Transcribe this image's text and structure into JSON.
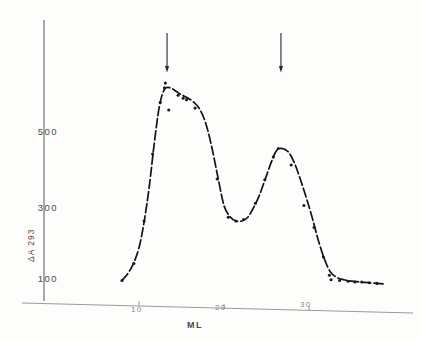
{
  "chart_data": {
    "type": "line",
    "title": "",
    "xlabel": "ML",
    "ylabel": "ΔA 293",
    "xlim": [
      0,
      40
    ],
    "ylim": [
      0,
      700
    ],
    "grid": false,
    "legend": null,
    "x_ticks": [
      {
        "value": 10,
        "label": "10"
      },
      {
        "value": 20,
        "label": "20"
      },
      {
        "value": 30,
        "label": "30"
      }
    ],
    "y_ticks": [
      {
        "value": 500,
        "label": "500"
      },
      {
        "value": 300,
        "label": "300"
      },
      {
        "value": 100,
        "label": "100"
      }
    ],
    "series": [
      {
        "name": "ΔA 293 elution profile",
        "style": "dashed-with-points",
        "x": [
          8.0,
          8.6,
          9.3,
          10.0,
          10.6,
          11.2,
          11.8,
          12.4,
          13.0,
          13.7,
          14.4,
          15.1,
          15.8,
          16.5,
          17.2,
          17.9,
          18.6,
          19.3,
          20.0,
          20.7,
          21.4,
          22.1,
          22.8,
          23.5,
          24.2,
          24.9,
          25.6,
          26.2,
          26.9,
          27.6,
          28.3,
          29.0,
          29.7,
          30.4,
          31.1,
          31.8,
          32.5,
          33.3,
          34.1,
          35.0,
          36.0,
          37.0,
          38.0,
          39.0
        ],
        "y": [
          96,
          112,
          140,
          185,
          255,
          350,
          470,
          570,
          616,
          620,
          610,
          600,
          592,
          580,
          560,
          520,
          455,
          375,
          300,
          270,
          258,
          258,
          268,
          295,
          330,
          375,
          420,
          450,
          455,
          445,
          415,
          370,
          320,
          265,
          205,
          155,
          120,
          104,
          98,
          94,
          92,
          90,
          88,
          86
        ]
      }
    ],
    "scatter_points": [
      {
        "x": 8.0,
        "y": 96
      },
      {
        "x": 9.4,
        "y": 142
      },
      {
        "x": 10.6,
        "y": 258
      },
      {
        "x": 11.6,
        "y": 440
      },
      {
        "x": 12.5,
        "y": 580
      },
      {
        "x": 13.0,
        "y": 620
      },
      {
        "x": 13.1,
        "y": 633
      },
      {
        "x": 13.5,
        "y": 560
      },
      {
        "x": 14.6,
        "y": 600
      },
      {
        "x": 15.2,
        "y": 592
      },
      {
        "x": 15.6,
        "y": 588
      },
      {
        "x": 16.6,
        "y": 565
      },
      {
        "x": 19.2,
        "y": 372
      },
      {
        "x": 20.5,
        "y": 268
      },
      {
        "x": 21.4,
        "y": 258
      },
      {
        "x": 22.3,
        "y": 262
      },
      {
        "x": 23.7,
        "y": 306
      },
      {
        "x": 24.8,
        "y": 370
      },
      {
        "x": 25.8,
        "y": 432
      },
      {
        "x": 26.4,
        "y": 455
      },
      {
        "x": 27.9,
        "y": 410
      },
      {
        "x": 29.4,
        "y": 300
      },
      {
        "x": 30.6,
        "y": 240
      },
      {
        "x": 31.7,
        "y": 160
      },
      {
        "x": 32.4,
        "y": 110
      },
      {
        "x": 32.6,
        "y": 98
      },
      {
        "x": 33.6,
        "y": 96
      },
      {
        "x": 34.6,
        "y": 94
      },
      {
        "x": 35.4,
        "y": 92
      },
      {
        "x": 36.2,
        "y": 92
      },
      {
        "x": 37.1,
        "y": 90
      },
      {
        "x": 38.0,
        "y": 88
      }
    ],
    "annotations": [
      {
        "type": "arrow",
        "direction": "down",
        "x": 13.3,
        "label": ""
      },
      {
        "type": "arrow",
        "direction": "down",
        "x": 26.7,
        "label": ""
      }
    ]
  },
  "axes": {
    "y_title": "ΔA 293",
    "x_title": "ML",
    "y_tick_labels": [
      "500",
      "300",
      "100"
    ],
    "x_tick_labels": [
      "10",
      "20",
      "30"
    ]
  },
  "colors": {
    "curve": "#1a1a1a",
    "axis": "#6e6e6e",
    "arrow": "#2b2b2b",
    "background": "#fdfdfc",
    "tick_text": "#4a4a4a"
  }
}
